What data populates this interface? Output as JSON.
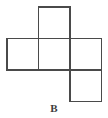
{
  "figure": {
    "kind": "cube-net-diagram",
    "label": "B",
    "stroke_color": "#4a4a4a",
    "fill_color": "#ffffff",
    "background_color": "#ffffff",
    "label_color": "#3d3d3d",
    "grid": {
      "cell_size": 31.5,
      "columns_x": [
        7,
        38.5,
        70,
        101.5
      ],
      "rows_y": [
        7,
        38.5,
        70,
        101.5
      ]
    },
    "squares": [
      {
        "name": "top-square",
        "col": 1,
        "row": 0,
        "x": 38.5,
        "y": 7,
        "w": 31.5,
        "h": 31.5
      },
      {
        "name": "middle-left-square",
        "col": 0,
        "row": 1,
        "x": 7,
        "y": 38.5,
        "w": 31.5,
        "h": 31.5
      },
      {
        "name": "middle-center-square",
        "col": 1,
        "row": 1,
        "x": 38.5,
        "y": 38.5,
        "w": 31.5,
        "h": 31.5
      },
      {
        "name": "middle-right-square",
        "col": 2,
        "row": 1,
        "x": 70,
        "y": 38.5,
        "w": 31.5,
        "h": 31.5
      },
      {
        "name": "bottom-square",
        "col": 2,
        "row": 2,
        "x": 70,
        "y": 70,
        "w": 31.5,
        "h": 31.5
      }
    ],
    "square_count": 5
  }
}
